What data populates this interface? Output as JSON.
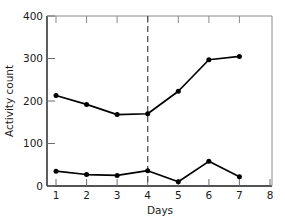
{
  "chart_data": {
    "type": "line",
    "title": "",
    "xlabel": "Days",
    "ylabel": "Activity count",
    "x": [
      1,
      2,
      3,
      4,
      5,
      6,
      7
    ],
    "xlim": [
      1,
      8
    ],
    "ylim": [
      0,
      400
    ],
    "xticks": [
      1,
      2,
      3,
      4,
      5,
      6,
      7,
      8
    ],
    "xticklabels": [
      "1",
      "2",
      "3",
      "4",
      "5",
      "6",
      "7",
      "8"
    ],
    "yticks": [
      0,
      100,
      200,
      300,
      400
    ],
    "yticklabels": [
      "0",
      "100",
      "200",
      "300",
      "400"
    ],
    "grid": false,
    "legend": "none",
    "series": [
      {
        "name": "upper",
        "values": [
          213,
          192,
          168,
          170,
          223,
          297,
          305
        ],
        "color": "#000000",
        "marker": "filled-circle"
      },
      {
        "name": "lower",
        "values": [
          35,
          27,
          25,
          36,
          10,
          58,
          22
        ],
        "color": "#000000",
        "marker": "filled-circle"
      }
    ],
    "annotations": [
      {
        "type": "vertical-dashed-line",
        "x": 4,
        "color": "#555555"
      }
    ],
    "axis_color": "#1a1a1a",
    "background": "#ffffff"
  },
  "labels": {
    "x_axis_title": "Days",
    "y_axis_title": "Activity count",
    "xtick_1": "1",
    "xtick_2": "2",
    "xtick_3": "3",
    "xtick_4": "4",
    "xtick_5": "5",
    "xtick_6": "6",
    "xtick_7": "7",
    "xtick_8": "8",
    "ytick_0": "0",
    "ytick_100": "100",
    "ytick_200": "200",
    "ytick_300": "300",
    "ytick_400": "400"
  }
}
